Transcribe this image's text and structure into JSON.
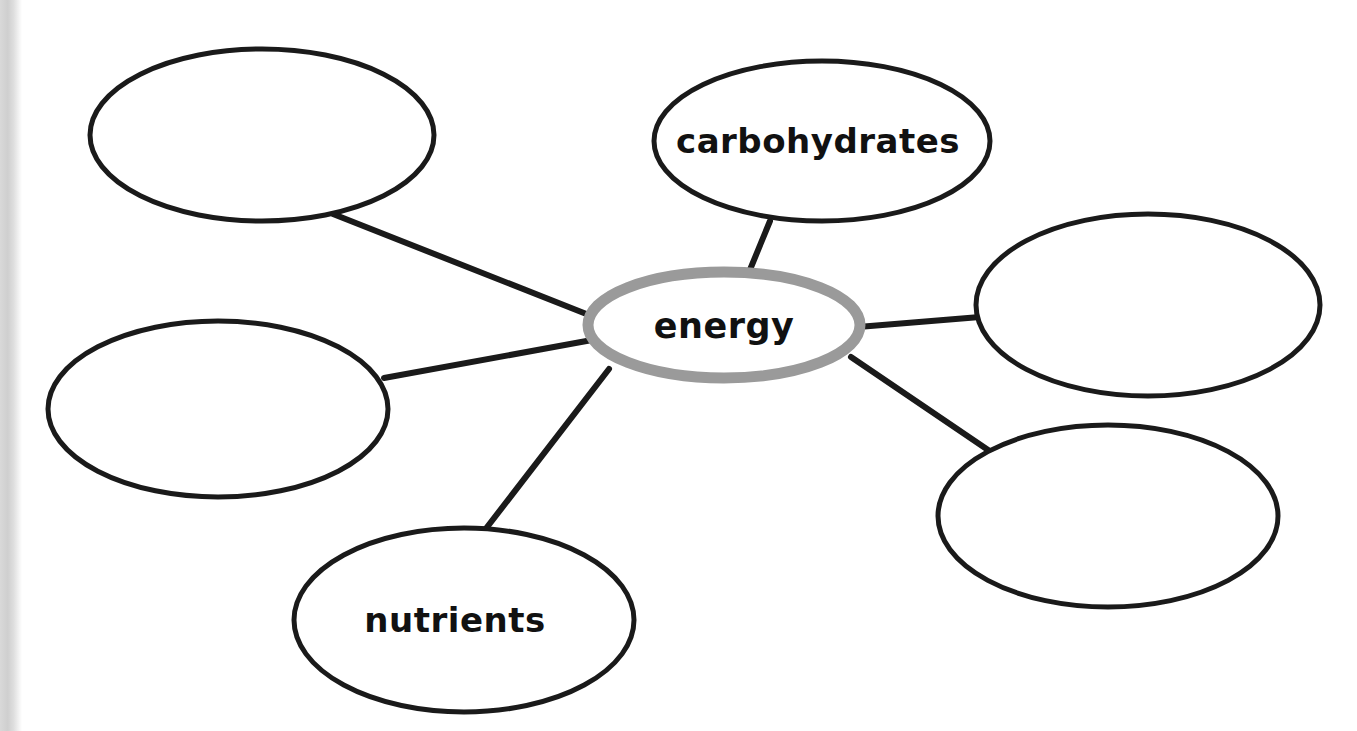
{
  "worksheet": {
    "type": "word-web-concept-map",
    "background_color": "#ffffff",
    "scan_edge_color": "#d4d4d4"
  },
  "center_node": {
    "id": "center",
    "label": "energy",
    "outline_color": "#9a9a9a",
    "fill_color": "#ffffff",
    "cx": 724,
    "cy": 325,
    "rx": 136,
    "ry": 53,
    "stroke_width": 11,
    "label_x": 724,
    "label_y": 338
  },
  "nodes": [
    {
      "id": "node-top-left",
      "label": "",
      "outline_color": "#1a1a1a",
      "fill_color": "#ffffff",
      "cx": 262,
      "cy": 135,
      "rx": 172,
      "ry": 86,
      "stroke_width": 5,
      "label_x": 262,
      "label_y": 148,
      "is_blank": true
    },
    {
      "id": "node-carbohydrates",
      "label": "carbohydrates",
      "outline_color": "#1a1a1a",
      "fill_color": "#ffffff",
      "cx": 822,
      "cy": 141,
      "rx": 168,
      "ry": 80,
      "stroke_width": 5,
      "label_x": 818,
      "label_y": 153,
      "is_blank": false
    },
    {
      "id": "node-right-upper",
      "label": "",
      "outline_color": "#1a1a1a",
      "fill_color": "#ffffff",
      "cx": 1148,
      "cy": 305,
      "rx": 172,
      "ry": 91,
      "stroke_width": 5,
      "label_x": 1148,
      "label_y": 318,
      "is_blank": true
    },
    {
      "id": "node-right-lower",
      "label": "",
      "outline_color": "#1a1a1a",
      "fill_color": "#ffffff",
      "cx": 1108,
      "cy": 516,
      "rx": 170,
      "ry": 91,
      "stroke_width": 5,
      "label_x": 1108,
      "label_y": 529,
      "is_blank": true
    },
    {
      "id": "node-nutrients",
      "label": "nutrients",
      "outline_color": "#1a1a1a",
      "fill_color": "#ffffff",
      "cx": 464,
      "cy": 620,
      "rx": 170,
      "ry": 92,
      "stroke_width": 5,
      "label_x": 455,
      "label_y": 632,
      "is_blank": false
    },
    {
      "id": "node-left-middle",
      "label": "",
      "outline_color": "#1a1a1a",
      "fill_color": "#ffffff",
      "cx": 218,
      "cy": 409,
      "rx": 170,
      "ry": 88,
      "stroke_width": 5,
      "label_x": 218,
      "label_y": 422,
      "is_blank": true
    }
  ],
  "connectors": [
    {
      "id": "connector-top-left",
      "from": "node-top-left",
      "to": "center",
      "x1": 333,
      "y1": 214,
      "x2": 594,
      "y2": 317,
      "color": "#1a1a1a",
      "width": 6
    },
    {
      "id": "connector-carbohydrates",
      "from": "node-carbohydrates",
      "to": "center",
      "x1": 770,
      "y1": 221,
      "x2": 747,
      "y2": 277,
      "color": "#1a1a1a",
      "width": 6
    },
    {
      "id": "connector-right-upper",
      "from": "center",
      "to": "node-right-upper",
      "x1": 858,
      "y1": 327,
      "x2": 980,
      "y2": 317,
      "color": "#1a1a1a",
      "width": 6
    },
    {
      "id": "connector-right-lower",
      "from": "center",
      "to": "node-right-lower",
      "x1": 851,
      "y1": 357,
      "x2": 994,
      "y2": 454,
      "color": "#1a1a1a",
      "width": 6
    },
    {
      "id": "connector-nutrients",
      "from": "center",
      "to": "node-nutrients",
      "x1": 609,
      "y1": 369,
      "x2": 481,
      "y2": 535,
      "color": "#1a1a1a",
      "width": 6
    },
    {
      "id": "connector-left-middle",
      "from": "node-left-middle",
      "to": "center",
      "x1": 384,
      "y1": 378,
      "x2": 592,
      "y2": 340,
      "color": "#1a1a1a",
      "width": 6
    }
  ]
}
